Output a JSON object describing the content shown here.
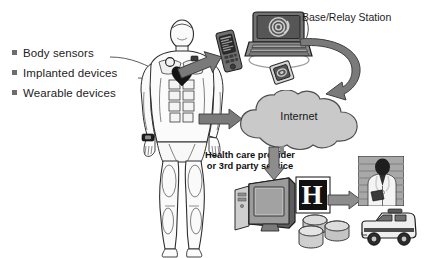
{
  "diagram": {
    "background_color": "#ffffff"
  },
  "bullets": {
    "items": [
      {
        "label": "Body sensors"
      },
      {
        "label": "Implanted devices"
      },
      {
        "label": "Wearable devices"
      }
    ]
  },
  "labels": {
    "base_station": "Base/Relay Station",
    "internet": "Internet",
    "provider": "Health care provider or 3rd party service",
    "hospital": "H"
  },
  "nodes": {
    "patient": {
      "name": "patient-body",
      "sensors": [
        "chest-sensor",
        "heart-implant",
        "wrist-wearable"
      ]
    },
    "pda": {
      "name": "pda-device"
    },
    "laptop": {
      "name": "laptop-device",
      "screen_glyph": "@"
    },
    "cloud": {
      "name": "internet-cloud"
    },
    "server": {
      "name": "healthcare-server"
    },
    "databases": {
      "name": "database-cylinders",
      "count": 3
    },
    "doctor": {
      "name": "doctor-photo"
    },
    "ambulance": {
      "name": "ambulance-vehicle"
    }
  },
  "colors": {
    "arrow_gray": "#7a7a7a",
    "cloud_fill": "#c9c9c9",
    "ink": "#1a1a1a",
    "mid_gray": "#9a9a9a",
    "dark": "#2b2b2b"
  }
}
